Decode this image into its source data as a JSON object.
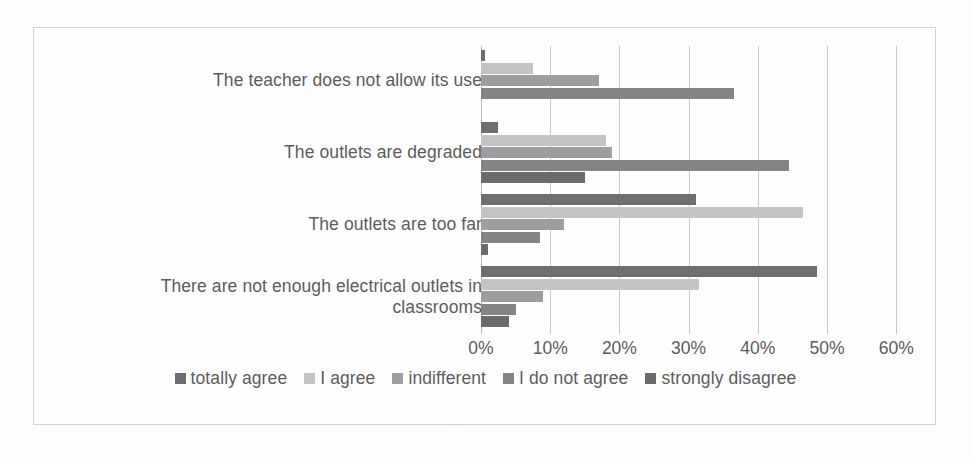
{
  "chart_data": {
    "type": "bar",
    "orientation": "horizontal",
    "title": "",
    "xlabel": "",
    "ylabel": "",
    "xlim": [
      0,
      60
    ],
    "xtick_labels": [
      "0%",
      "10%",
      "20%",
      "30%",
      "40%",
      "50%",
      "60%"
    ],
    "xticks": [
      0,
      10,
      20,
      30,
      40,
      50,
      60
    ],
    "grid": true,
    "legend_position": "bottom",
    "categories": [
      "The teacher does not allow its use",
      "The outlets are degraded",
      "The outlets are too far",
      "There are not enough electrical outlets in classrooms"
    ],
    "series": [
      {
        "name": "totally agree",
        "color": "#6e6e6e",
        "values": [
          0.6,
          2.5,
          31.0,
          48.5
        ]
      },
      {
        "name": "I agree",
        "color": "#c4c4c4",
        "values": [
          7.5,
          18.0,
          46.5,
          31.5
        ]
      },
      {
        "name": "indifferent",
        "color": "#9e9e9e",
        "values": [
          17.0,
          19.0,
          12.0,
          9.0
        ]
      },
      {
        "name": "I do not agree",
        "color": "#848484",
        "values": [
          36.5,
          44.5,
          8.5,
          5.0
        ]
      },
      {
        "name": "strongly disagree",
        "color": "#6b6b6b",
        "values": [
          0.0,
          15.0,
          1.0,
          4.0
        ]
      }
    ]
  },
  "legend": {
    "items": [
      {
        "label": "totally agree"
      },
      {
        "label": "I agree"
      },
      {
        "label": "indifferent"
      },
      {
        "label": "I do not agree"
      },
      {
        "label": "strongly disagree"
      }
    ]
  },
  "colors": {
    "frame_border": "#d4d4d4",
    "gridline": "#c9c9c9",
    "text": "#5c5c5c",
    "background": "#fefefe"
  }
}
